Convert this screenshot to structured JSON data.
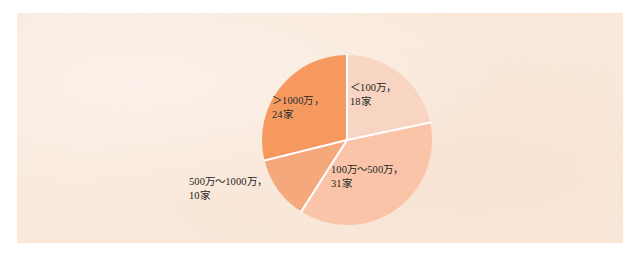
{
  "chart_data": {
    "type": "pie",
    "title": "",
    "subtitle": "",
    "xlabel": "",
    "ylabel": "",
    "unit_label": "家",
    "total": 83,
    "legend_position": "none",
    "grid": false,
    "start_angle_deg": 0,
    "direction": "clockwise",
    "categories": [
      "<100万",
      "100万~500万",
      "500万~1000万",
      ">1000万"
    ],
    "values": [
      18,
      31,
      10,
      24
    ],
    "slices": [
      {
        "category": "<100万",
        "value": 24,
        "label_line1": "＜100万，",
        "label_line2": "18家",
        "count_text": "18家",
        "color": "#f8d5c2",
        "start_angle_deg": 0.0,
        "end_angle_deg": 78.1,
        "percent": 21.7
      },
      {
        "category": "100万~500万",
        "value": 31,
        "label_line1": "100万～500万，",
        "label_line2": "31家",
        "count_text": "31家",
        "color": "#f9c4a8",
        "start_angle_deg": 78.1,
        "end_angle_deg": 212.6,
        "percent": 37.3
      },
      {
        "category": "500万~1000万",
        "value": 10,
        "label_line1": "500万～1000万，",
        "label_line2": "10家",
        "count_text": "10家",
        "color": "#f5a87c",
        "start_angle_deg": 212.6,
        "end_angle_deg": 256.0,
        "percent": 12.0
      },
      {
        "category": ">1000万",
        "value": 24,
        "label_line1": "＞1000万，",
        "label_line2": "24家",
        "count_text": "24家",
        "color": "#f5995f",
        "start_angle_deg": 256.0,
        "end_angle_deg": 360.0,
        "percent": 28.9
      }
    ]
  },
  "labels": {
    "lt100": {
      "line1": "＜100万，",
      "line2": "18家"
    },
    "r100_500": {
      "line1": "100万～500万，",
      "line2": "31家"
    },
    "r500_1000": {
      "line1": "500万～1000万，",
      "line2": "10家"
    },
    "gt1000": {
      "line1": "＞1000万，",
      "line2": "24家"
    }
  },
  "colors": {
    "page_background": "#ffffff",
    "panel_background": "#fbeadc",
    "slice_divider": "#ffffff",
    "label_text": "#231f20",
    "slice_lightest": "#f8d5c2",
    "slice_light": "#f9c4a8",
    "slice_medium": "#f5a87c",
    "slice_dark": "#f5995f"
  }
}
